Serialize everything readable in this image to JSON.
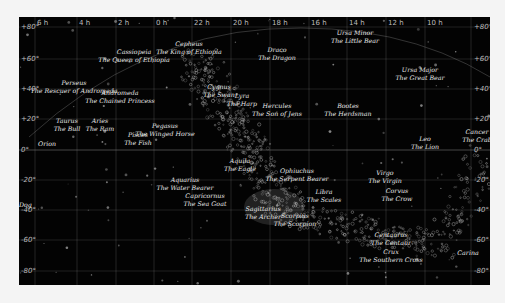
{
  "map": {
    "background": "#030303",
    "grid_color": "#9a9a9a",
    "ra_labels": [
      {
        "text": "6 h",
        "x": 18
      },
      {
        "text": "4 h",
        "x": 60
      },
      {
        "text": "2 h",
        "x": 99
      },
      {
        "text": "0 h",
        "x": 137
      },
      {
        "text": "22 h",
        "x": 175
      },
      {
        "text": "20 h",
        "x": 214
      },
      {
        "text": "18 h",
        "x": 253
      },
      {
        "text": "16 h",
        "x": 292
      },
      {
        "text": "14 h",
        "x": 330
      },
      {
        "text": "12 h",
        "x": 369
      },
      {
        "text": "10 h",
        "x": 408
      }
    ],
    "dec_labels_left": [
      {
        "text": "+80°",
        "y": 6
      },
      {
        "text": "+60°",
        "y": 38
      },
      {
        "text": "+40°",
        "y": 68
      },
      {
        "text": "+20°",
        "y": 98
      },
      {
        "text": "0°",
        "y": 129
      },
      {
        "text": "-20°",
        "y": 159
      },
      {
        "text": "-40°",
        "y": 189
      },
      {
        "text": "-60°",
        "y": 219
      },
      {
        "text": "-80°",
        "y": 250
      }
    ],
    "dec_labels_right": [
      {
        "text": "+80°",
        "y": 6
      },
      {
        "text": "+60°",
        "y": 38
      },
      {
        "text": "+40°",
        "y": 68
      },
      {
        "text": "+20°",
        "y": 98
      },
      {
        "text": "0°",
        "y": 129
      },
      {
        "text": "-20°",
        "y": 159
      },
      {
        "text": "-40°",
        "y": 189
      },
      {
        "text": "-60°",
        "y": 219
      },
      {
        "text": "-80°",
        "y": 250
      }
    ],
    "constellations": [
      {
        "name": "Cassiopeia",
        "meaning": "The Queen of Ethiopia",
        "x": 115,
        "y": 31
      },
      {
        "name": "Cepheus",
        "meaning": "The King of Ethiopia",
        "x": 170,
        "y": 23
      },
      {
        "name": "Draco",
        "meaning": "The Dragon",
        "x": 258,
        "y": 29
      },
      {
        "name": "Ursa Minor",
        "meaning": "The Little Bear",
        "x": 336,
        "y": 12
      },
      {
        "name": "Ursa Major",
        "meaning": "The Great Bear",
        "x": 401,
        "y": 49
      },
      {
        "name": "Perseus",
        "meaning": "The Rescuer of Andromeda",
        "x": 55,
        "y": 62
      },
      {
        "name": "Andromeda",
        "meaning": "The Chained Princess",
        "x": 101,
        "y": 72
      },
      {
        "name": "Cygnus",
        "meaning": "The Swan",
        "x": 200,
        "y": 66
      },
      {
        "name": "Lyra",
        "meaning": "The Harp",
        "x": 223,
        "y": 75
      },
      {
        "name": "Hercules",
        "meaning": "The Son of Jens",
        "x": 258,
        "y": 85
      },
      {
        "name": "Bootes",
        "meaning": "The Herdsman",
        "x": 329,
        "y": 85
      },
      {
        "name": "Taurus",
        "meaning": "The Bull",
        "x": 48,
        "y": 100
      },
      {
        "name": "Aries",
        "meaning": "The Ram",
        "x": 81,
        "y": 100
      },
      {
        "name": "Pisces",
        "meaning": "The Fish",
        "x": 119,
        "y": 114
      },
      {
        "name": "Pegasus",
        "meaning": "The Winged Horse",
        "x": 146,
        "y": 105
      },
      {
        "name": "Aquila",
        "meaning": "The Eagle",
        "x": 221,
        "y": 140
      },
      {
        "name": "Ophiuchus",
        "meaning": "The Serpent Bearer",
        "x": 278,
        "y": 150
      },
      {
        "name": "Leo",
        "meaning": "The Lion",
        "x": 406,
        "y": 118
      },
      {
        "name": "Cancer",
        "meaning": "The Crab",
        "x": 458,
        "y": 111
      },
      {
        "name": "Virgo",
        "meaning": "The Virgin",
        "x": 366,
        "y": 152
      },
      {
        "name": "Corvus",
        "meaning": "The Crow",
        "x": 378,
        "y": 170
      },
      {
        "name": "Libra",
        "meaning": "The Scales",
        "x": 305,
        "y": 171
      },
      {
        "name": "Aquarius",
        "meaning": "The Water Bearer",
        "x": 166,
        "y": 159
      },
      {
        "name": "Capricornus",
        "meaning": "The Sea Goat",
        "x": 186,
        "y": 175
      },
      {
        "name": "Sagittarius",
        "meaning": "The Archer",
        "x": 244,
        "y": 188
      },
      {
        "name": "Scorpius",
        "meaning": "The Scorpion",
        "x": 276,
        "y": 195
      },
      {
        "name": "Centaurus",
        "meaning": "The Centaur",
        "x": 372,
        "y": 214
      },
      {
        "name": "Crux",
        "meaning": "The Southern Cross",
        "x": 372,
        "y": 231
      },
      {
        "name": "Carina",
        "meaning": "",
        "x": 449,
        "y": 232
      },
      {
        "name": "Orion",
        "meaning": "",
        "x": 28,
        "y": 123
      },
      {
        "name": "Gemini",
        "meaning": "",
        "x": 484,
        "y": 84
      },
      {
        "name": "Big Dog",
        "meaning": "",
        "x": 0,
        "y": 184
      }
    ]
  }
}
